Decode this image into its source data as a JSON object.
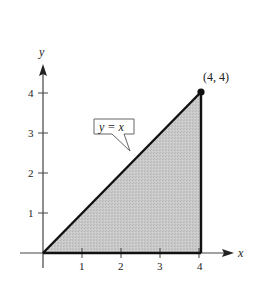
{
  "figure": {
    "type": "region-under-line",
    "axes": {
      "x_label": "x",
      "y_label": "y",
      "x_ticks": [
        "1",
        "2",
        "3",
        "4"
      ],
      "y_ticks": [
        "1",
        "2",
        "3",
        "4"
      ]
    },
    "curve_label": "y = x",
    "point_label": "(4, 4)",
    "region": {
      "vertices": [
        [
          0,
          0
        ],
        [
          4,
          4
        ],
        [
          4,
          0
        ]
      ],
      "fill": "#c8c8c8"
    },
    "colors": {
      "axis": "#444444",
      "boundary": "#111111",
      "shade": "#c8c8c8"
    }
  }
}
